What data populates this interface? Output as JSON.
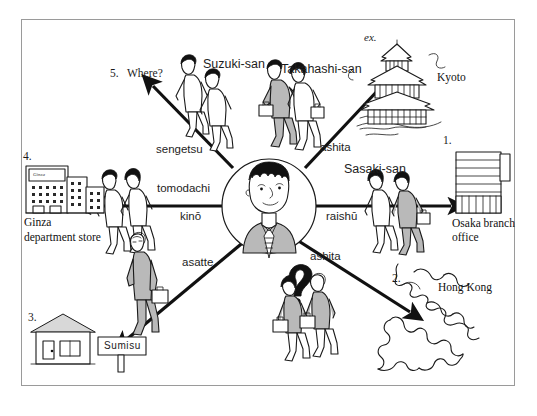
{
  "diagram": {
    "center": {
      "name": "central-speaker",
      "description": "man-in-suit-portrait"
    },
    "colors": {
      "ink": "#1a1a1a",
      "frame": "#9a9a9a",
      "fill_gray": "#b9b9b9",
      "fill_light": "#e8e8e8",
      "paper": "#ffffff"
    },
    "branches": [
      {
        "id": "osaka",
        "number": "1.",
        "time_word": "raishū",
        "companion": "Sasaki-san",
        "destination_line1": "Osaka branch",
        "destination_line2": "office",
        "direction": "right"
      },
      {
        "id": "hongkong",
        "number": "2.",
        "time_word": "ashita",
        "companion": "",
        "destination_line1": "Hong Kong",
        "destination_line2": "",
        "direction": "down-right"
      },
      {
        "id": "sumisu",
        "number": "3.",
        "time_word": "asatte",
        "companion": "",
        "destination_line1": "Sumisu",
        "destination_line2": "",
        "direction": "down-left"
      },
      {
        "id": "ginza",
        "number": "4.",
        "time_word": "kinō",
        "companion": "tomodachi",
        "destination_line1": "Ginza",
        "destination_line2": "department store",
        "direction": "left"
      },
      {
        "id": "where",
        "number": "5.",
        "time_word": "sengetsu",
        "companion": "Suzuki-san",
        "destination_line1": "Where?",
        "destination_line2": "",
        "direction": "up-left"
      },
      {
        "id": "kyoto",
        "number": "ex.",
        "time_word": "ashita",
        "companion": "Takahashi-san",
        "destination_line1": "Kyoto",
        "destination_line2": "",
        "direction": "up-right"
      }
    ],
    "labels": {
      "where_number": "5.",
      "where_text": "Where?",
      "suzuki": "Suzuki-san",
      "takahashi": "Takahashi-san",
      "ex": "ex.",
      "kyoto": "Kyoto",
      "sengetsu": "sengetsu",
      "ashita_top": "ashita",
      "sasaki": "Sasaki-san",
      "one": "1.",
      "osaka_1": "Osaka branch",
      "osaka_2": "office",
      "raishu": "raishū",
      "four": "4.",
      "ginza_sign": "Ginza",
      "ginza_1": "Ginza",
      "ginza_2": "department store",
      "tomodachi": "tomodachi",
      "kino": "kinō",
      "asatte": "asatte",
      "ashita_bottom": "ashita",
      "two": "2.",
      "hongkong": "Hong Kong",
      "three": "3.",
      "sumisu": "Sumisu",
      "question_mark": "?"
    }
  }
}
